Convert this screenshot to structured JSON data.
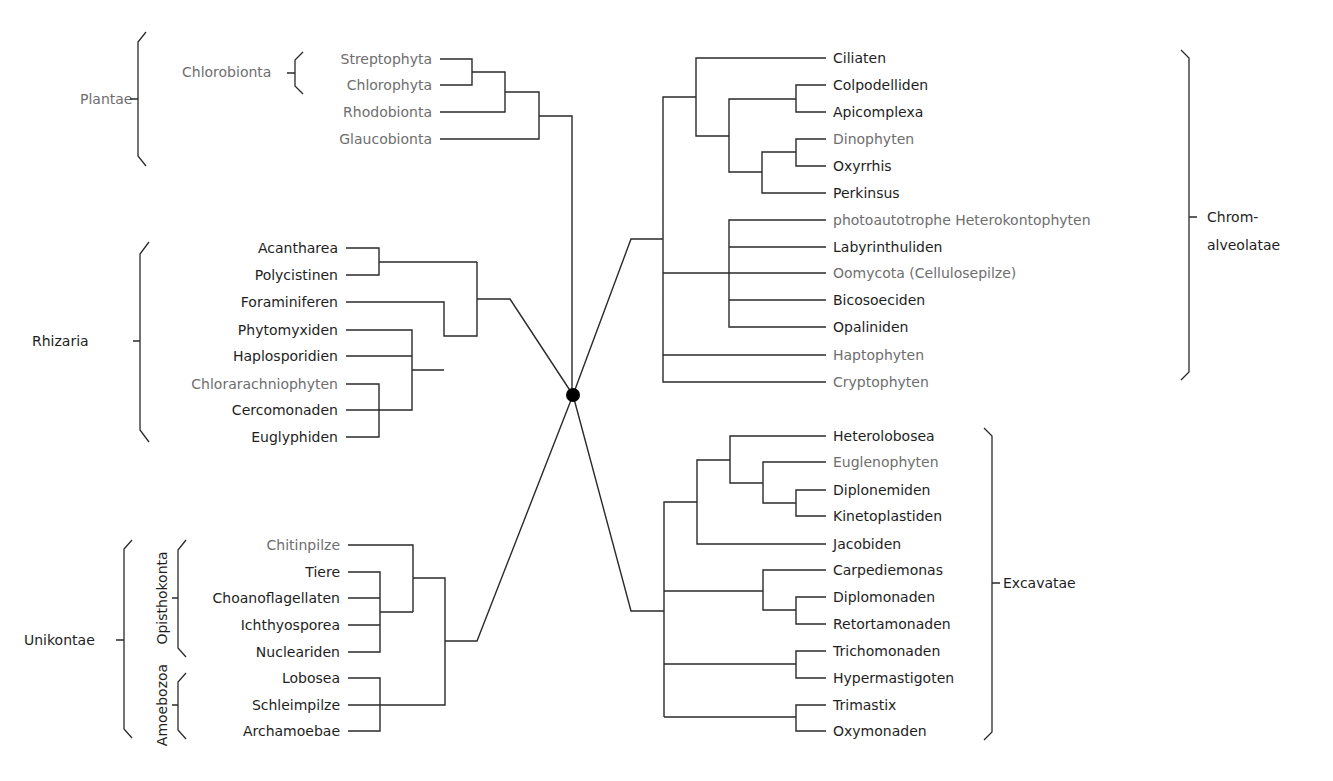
{
  "diagram": {
    "type": "unrooted-star-phylogeny",
    "center": {
      "x": 573,
      "y": 395,
      "r": 7
    },
    "supergroups": {
      "plantae": {
        "label": "Plantae",
        "subgroup": {
          "label": "Chlorobionta"
        },
        "taxa": [
          {
            "name": "Streptophyta",
            "photosynthetic": true
          },
          {
            "name": "Chlorophyta",
            "photosynthetic": true
          },
          {
            "name": "Rhodobionta",
            "photosynthetic": true
          },
          {
            "name": "Glaucobionta",
            "photosynthetic": true
          }
        ]
      },
      "rhizaria": {
        "label": "Rhizaria",
        "taxa": [
          {
            "name": "Acantharea",
            "photosynthetic": false
          },
          {
            "name": "Polycistinen",
            "photosynthetic": false
          },
          {
            "name": "Foraminiferen",
            "photosynthetic": false
          },
          {
            "name": "Phytomyxiden",
            "photosynthetic": false
          },
          {
            "name": "Haplosporidien",
            "photosynthetic": false
          },
          {
            "name": "Chlorarachniophyten",
            "photosynthetic": true
          },
          {
            "name": "Cercomonaden",
            "photosynthetic": false
          },
          {
            "name": "Euglyphiden",
            "photosynthetic": false
          }
        ]
      },
      "unikontae": {
        "label": "Unikontae",
        "subgroups": [
          {
            "label": "Opisthokonta"
          },
          {
            "label": "Amoebozoa"
          }
        ],
        "taxa": [
          {
            "name": "Chitinpilze",
            "photosynthetic": true
          },
          {
            "name": "Tiere",
            "photosynthetic": false
          },
          {
            "name": "Choanoflagellaten",
            "photosynthetic": false
          },
          {
            "name": "Ichthyosporea",
            "photosynthetic": false
          },
          {
            "name": "Nucleariden",
            "photosynthetic": false
          },
          {
            "name": "Lobosea",
            "photosynthetic": false
          },
          {
            "name": "Schleimpilze",
            "photosynthetic": false
          },
          {
            "name": "Archamoebae",
            "photosynthetic": false
          }
        ]
      },
      "chromalveolatae": {
        "label_line1": "Chrom-",
        "label_line2": "alveolatae",
        "taxa": [
          {
            "name": "Ciliaten",
            "photosynthetic": false
          },
          {
            "name": "Colpodelliden",
            "photosynthetic": false
          },
          {
            "name": "Apicomplexa",
            "photosynthetic": false
          },
          {
            "name": "Dinophyten",
            "photosynthetic": true
          },
          {
            "name": "Oxyrrhis",
            "photosynthetic": false
          },
          {
            "name": "Perkinsus",
            "photosynthetic": false
          },
          {
            "name": "photoautotrophe Heterokontophyten",
            "photosynthetic": true
          },
          {
            "name": "Labyrinthuliden",
            "photosynthetic": false
          },
          {
            "name": "Oomycota (Cellulosepilze)",
            "photosynthetic": true
          },
          {
            "name": "Bicosoeciden",
            "photosynthetic": false
          },
          {
            "name": "Opaliniden",
            "photosynthetic": false
          },
          {
            "name": "Haptophyten",
            "photosynthetic": true
          },
          {
            "name": "Cryptophyten",
            "photosynthetic": true
          }
        ]
      },
      "excavatae": {
        "label": "Excavatae",
        "taxa": [
          {
            "name": "Heterolobosea",
            "photosynthetic": false
          },
          {
            "name": "Euglenophyten",
            "photosynthetic": true
          },
          {
            "name": "Diplonemiden",
            "photosynthetic": false
          },
          {
            "name": "Kinetoplastiden",
            "photosynthetic": false
          },
          {
            "name": "Jacobiden",
            "photosynthetic": false
          },
          {
            "name": "Carpediemonas",
            "photosynthetic": false
          },
          {
            "name": "Diplomonaden",
            "photosynthetic": false
          },
          {
            "name": "Retortamonaden",
            "photosynthetic": false
          },
          {
            "name": "Trichomonaden",
            "photosynthetic": false
          },
          {
            "name": "Hypermastigoten",
            "photosynthetic": false
          },
          {
            "name": "Trimastix",
            "photosynthetic": false
          },
          {
            "name": "Oxymonaden",
            "photosynthetic": false
          }
        ]
      }
    },
    "colors": {
      "line": "#2a2a2a",
      "text": "#1e1e1e",
      "photosynthetic_text": "#6e6e6e",
      "background": "#ffffff"
    }
  }
}
